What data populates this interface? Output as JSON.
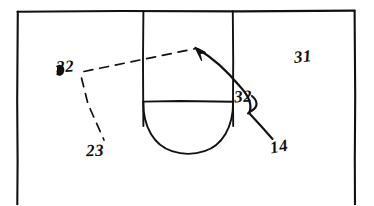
{
  "figure": {
    "type": "patent-line-drawing",
    "background_color": "#ffffff",
    "ink_color": "#111111"
  },
  "labels": {
    "ref_22": "22",
    "ref_23": "23",
    "ref_31": "31",
    "ref_32": "32",
    "ref_14": "14"
  },
  "geometry": {
    "outer_rectangle": {
      "x": 17,
      "y": 11,
      "width": 338,
      "height": 196
    },
    "recess_left_wall_x": 143,
    "recess_right_wall_x": 233,
    "recess_shoulder_y": 101,
    "recess_bottom_y": 152,
    "recess_top_y": 11
  },
  "leaders": {
    "dashed_22_to_arrow": {
      "style": "dashed",
      "from": [
        84,
        72
      ],
      "to": [
        196,
        49
      ]
    },
    "dashed_22_to_23": {
      "style": "dashed",
      "from": [
        82,
        78
      ],
      "to": [
        104,
        140
      ]
    },
    "curved_arrow_to_recess_wall": {
      "style": "solid-curved-with-arrowhead",
      "from": [
        248,
        112
      ],
      "to": [
        196,
        48
      ]
    },
    "solid_14_to_32": {
      "style": "solid",
      "from": [
        272,
        140
      ],
      "to": [
        248,
        112
      ]
    }
  }
}
